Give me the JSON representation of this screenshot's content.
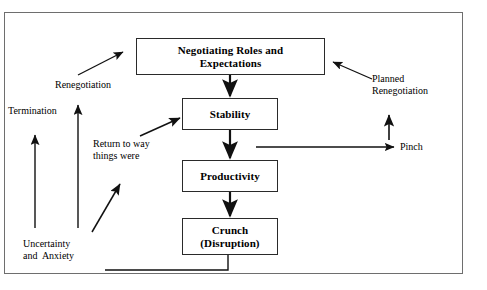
{
  "diagram": {
    "type": "flowchart",
    "background_color": "#ffffff",
    "frame_color": "#6e6e6e",
    "line_color": "#2a2a2a",
    "text_color": "#000000"
  },
  "nodes": {
    "negotiating": {
      "line1": "Negotiating Roles and",
      "line2": "Expectations"
    },
    "stability": {
      "line1": "Stability"
    },
    "productivity": {
      "line1": "Productivity"
    },
    "crunch": {
      "line1": "Crunch",
      "line2": "(Disruption)"
    }
  },
  "labels": {
    "renegotiation": "Renegotiation",
    "termination": "Termination",
    "return_to_way": "Return to way\nthings were",
    "uncertainty": "Uncertainty\nand  Anxiety",
    "planned_renegotiation": "Planned\nRenegotiation",
    "pinch": "Pinch"
  }
}
